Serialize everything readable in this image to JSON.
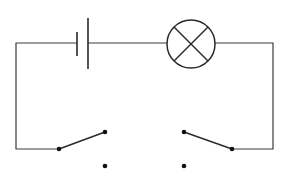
{
  "diagram": {
    "type": "circuit",
    "components": [
      {
        "id": "battery",
        "kind": "cell",
        "short_plate_x": 77,
        "long_plate_x": 88
      },
      {
        "id": "lamp",
        "kind": "lamp",
        "cx": 191,
        "cy": 44,
        "r": 24
      },
      {
        "id": "switch-left",
        "kind": "spdt-switch",
        "pivot": [
          59,
          149
        ],
        "contacts": [
          [
            105,
            132
          ],
          [
            105,
            166
          ]
        ],
        "position": "upper"
      },
      {
        "id": "switch-right",
        "kind": "spdt-switch",
        "pivot": [
          232,
          149
        ],
        "contacts": [
          [
            184,
            132
          ],
          [
            184,
            166
          ]
        ],
        "position": "upper"
      }
    ],
    "colors": {
      "line": "#3a3a3a",
      "background": "#ffffff"
    }
  }
}
